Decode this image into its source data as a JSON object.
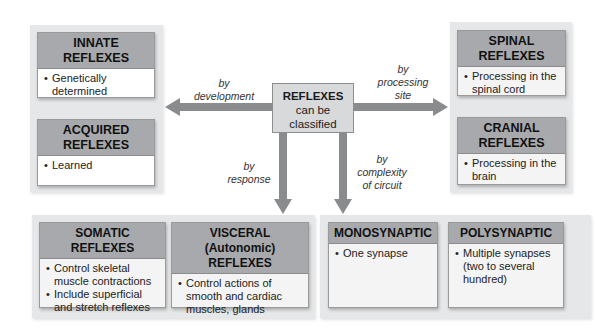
{
  "center": {
    "title": "REFLEXES",
    "line1": "can be",
    "line2": "classified"
  },
  "arrows": {
    "development": {
      "line1": "by",
      "line2": "development"
    },
    "processing_site": {
      "line1": "by",
      "line2": "processing",
      "line3": "site"
    },
    "response": {
      "line1": "by",
      "line2": "response"
    },
    "complexity": {
      "line1": "by",
      "line2": "complexity",
      "line3": "of circuit"
    }
  },
  "development_group": {
    "innate": {
      "title_line1": "INNATE",
      "title_line2": "REFLEXES",
      "bullets": [
        "Genetically determined"
      ]
    },
    "acquired": {
      "title_line1": "ACQUIRED",
      "title_line2": "REFLEXES",
      "bullets": [
        "Learned"
      ]
    }
  },
  "site_group": {
    "spinal": {
      "title_line1": "SPINAL",
      "title_line2": "REFLEXES",
      "bullets": [
        "Processing in the spinal cord"
      ]
    },
    "cranial": {
      "title_line1": "CRANIAL",
      "title_line2": "REFLEXES",
      "bullets": [
        "Processing in the brain"
      ]
    }
  },
  "response_group": {
    "somatic": {
      "title_line1": "SOMATIC REFLEXES",
      "bullets": [
        "Control skeletal muscle contractions",
        "Include superficial and stretch reflexes"
      ]
    },
    "visceral": {
      "title_line1": "VISCERAL (Autonomic)",
      "title_line2": "REFLEXES",
      "bullets": [
        "Control actions of smooth and cardiac muscles, glands"
      ]
    }
  },
  "complexity_group": {
    "mono": {
      "title_line1": "MONOSYNAPTIC",
      "bullets": [
        "One synapse"
      ]
    },
    "poly": {
      "title_line1": "POLYSYNAPTIC",
      "bullets": [
        "Multiple synapses (two to several hundred)"
      ]
    }
  },
  "colors": {
    "panel": "#e6e7e8",
    "header": "#a7a9ac",
    "arrow": "#8a8b8d",
    "center": "#d8d9db"
  }
}
